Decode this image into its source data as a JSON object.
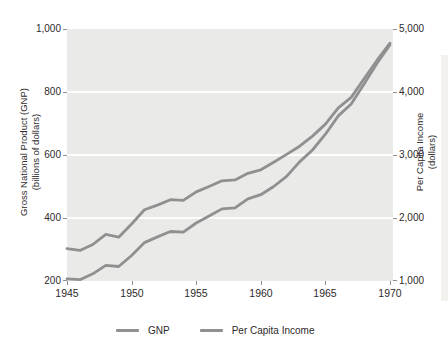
{
  "figure": {
    "legend": [
      {
        "label": "GNP"
      },
      {
        "label": "Per Capita Income"
      }
    ]
  },
  "chart_data": {
    "type": "line",
    "title": "",
    "x": [
      1945,
      1946,
      1947,
      1948,
      1949,
      1950,
      1951,
      1952,
      1953,
      1954,
      1955,
      1956,
      1957,
      1958,
      1959,
      1960,
      1961,
      1962,
      1963,
      1964,
      1965,
      1966,
      1967,
      1968,
      1969,
      1970
    ],
    "x_tick_labels": [
      "1945",
      "1950",
      "1955",
      "1960",
      "1965",
      "1970"
    ],
    "xlim": [
      1945,
      1970
    ],
    "grid": "horizontal-white-on-gray",
    "legend_position": "bottom",
    "plot_bg_color": "#eaeae8",
    "gridline_color": "#fdfdfc",
    "left_axis": {
      "label_line1": "Gross National Product (GNP)",
      "label_line2": "(billions of dollars)",
      "ticks": [
        "1,000",
        "800",
        "600",
        "400",
        "200"
      ],
      "lim": [
        200,
        1000
      ]
    },
    "right_axis": {
      "label_line1": "Per Capita Income",
      "label_line2": "(dollars)",
      "ticks": [
        "5,000",
        "4,000",
        "3,000",
        "2,000",
        "1,000"
      ],
      "lim": [
        1000,
        5000
      ]
    },
    "series": [
      {
        "name": "GNP",
        "axis": "left",
        "units": "billions of dollars",
        "color": "#909090",
        "values": [
          207,
          204,
          223,
          250,
          246,
          281,
          322,
          340,
          357,
          355,
          384,
          406,
          429,
          432,
          461,
          474,
          500,
          532,
          578,
          616,
          666,
          724,
          762,
          826,
          891,
          950
        ]
      },
      {
        "name": "Per Capita Income",
        "axis": "right",
        "units": "dollars",
        "color": "#909090",
        "values": [
          1515,
          1485,
          1580,
          1740,
          1695,
          1905,
          2130,
          2205,
          2290,
          2280,
          2415,
          2500,
          2590,
          2605,
          2710,
          2765,
          2885,
          3010,
          3140,
          3300,
          3490,
          3750,
          3915,
          4215,
          4505,
          4775
        ]
      }
    ]
  }
}
